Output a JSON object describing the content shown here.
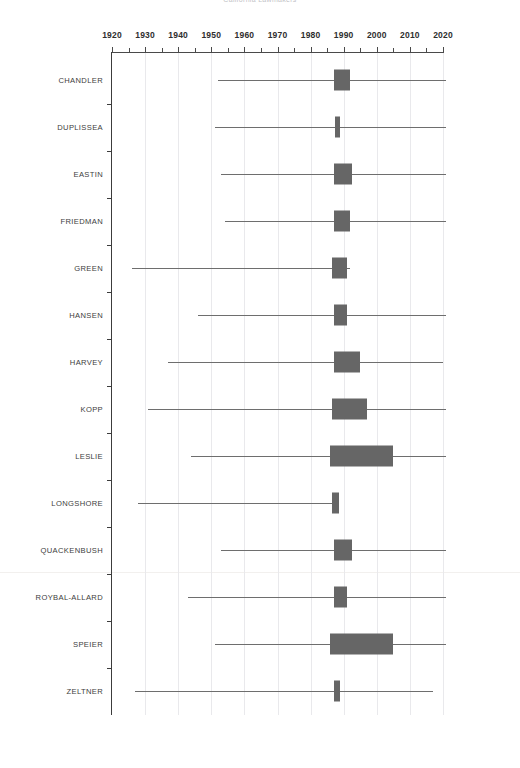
{
  "chart_data": {
    "type": "box",
    "title": "California Lawmakers",
    "xlabel": "",
    "ylabel": "",
    "xlim": [
      1920,
      2020
    ],
    "tick_labels": [
      1920,
      1930,
      1940,
      1950,
      1960,
      1970,
      1980,
      1990,
      2000,
      2010,
      2020
    ],
    "minor_tick_step": 5,
    "major_tick_step": 10,
    "grid": "vertical-decades",
    "legend": "none",
    "orientation": "horizontal",
    "box_color": "#666666",
    "whisker_color": "#6e6e6e",
    "axis_color": "#3c3c3c",
    "gridline_color": "#e9e9ec",
    "categories": [
      "CHANDLER",
      "DUPLISSEA",
      "EASTIN",
      "FRIEDMAN",
      "GREEN",
      "HANSEN",
      "HARVEY",
      "KOPP",
      "LESLIE",
      "LONGSHORE",
      "QUACKENBUSH",
      "ROYBAL-ALLARD",
      "SPEIER",
      "ZELTNER"
    ],
    "boxes": [
      {
        "name": "CHANDLER",
        "whisker_low": 1952,
        "q1": 1987.0,
        "q3": 1992.0,
        "whisker_high": 2021
      },
      {
        "name": "DUPLISSEA",
        "whisker_low": 1951,
        "q1": 1987.5,
        "q3": 1989.0,
        "whisker_high": 2021
      },
      {
        "name": "EASTIN",
        "whisker_low": 1953,
        "q1": 1987.0,
        "q3": 1992.5,
        "whisker_high": 2021
      },
      {
        "name": "FRIEDMAN",
        "whisker_low": 1954,
        "q1": 1987.0,
        "q3": 1992.0,
        "whisker_high": 2021
      },
      {
        "name": "GREEN",
        "whisker_low": 1926,
        "q1": 1986.5,
        "q3": 1991.0,
        "whisker_high": 1992
      },
      {
        "name": "HANSEN",
        "whisker_low": 1946,
        "q1": 1987.0,
        "q3": 1991.0,
        "whisker_high": 2021
      },
      {
        "name": "HARVEY",
        "whisker_low": 1937,
        "q1": 1987.0,
        "q3": 1995.0,
        "whisker_high": 2020
      },
      {
        "name": "KOPP",
        "whisker_low": 1931,
        "q1": 1986.5,
        "q3": 1997.0,
        "whisker_high": 2021
      },
      {
        "name": "LESLIE",
        "whisker_low": 1944,
        "q1": 1986.0,
        "q3": 2005.0,
        "whisker_high": 2021
      },
      {
        "name": "LONGSHORE",
        "whisker_low": 1928,
        "q1": 1986.5,
        "q3": 1988.5,
        "whisker_high": 1988.5
      },
      {
        "name": "QUACKENBUSH",
        "whisker_low": 1953,
        "q1": 1987.0,
        "q3": 1992.5,
        "whisker_high": 2021
      },
      {
        "name": "ROYBAL-ALLARD",
        "whisker_low": 1943,
        "q1": 1987.0,
        "q3": 1991.0,
        "whisker_high": 2021
      },
      {
        "name": "SPEIER",
        "whisker_low": 1951,
        "q1": 1986.0,
        "q3": 2005.0,
        "whisker_high": 2021
      },
      {
        "name": "ZELTNER",
        "whisker_low": 1927,
        "q1": 1987.0,
        "q3": 1989.0,
        "whisker_high": 2017
      }
    ]
  }
}
